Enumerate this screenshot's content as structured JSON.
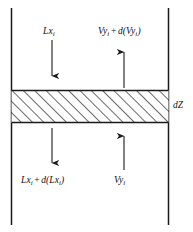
{
  "figure": {
    "canvas": {
      "width": 193,
      "height": 232
    },
    "colors": {
      "line": "#1a1a1a",
      "text": "#101010",
      "background": "#ffffff"
    }
  },
  "labels": {
    "liquid_in": {
      "base": "Lx",
      "sub": "i"
    },
    "vapor_out": {
      "base1": "Vy",
      "sub1": "i",
      "operator": "+",
      "base2": "d(Vy",
      "sub2": "i",
      "close": ")"
    },
    "liquid_out": {
      "base1": "Lx",
      "sub1": "i",
      "operator": "+",
      "base2": "d(Lx",
      "sub2": "i",
      "close": ")"
    },
    "vapor_in": {
      "base": "Vy",
      "sub": "i"
    },
    "height_element": "dZ"
  },
  "geometry": {
    "left_wall_x": 11,
    "right_wall_x": 168,
    "wall_top_y": 8,
    "wall_bottom_y": 225,
    "band_top_y": 90,
    "band_bottom_y": 123,
    "hatch_angle_deg": 45,
    "hatch_spacing_px": 8
  },
  "arrows": [
    {
      "name": "liquid-in-arrow",
      "direction": "down",
      "x": 52,
      "from_y": 40,
      "to_y": 83
    },
    {
      "name": "vapor-out-arrow",
      "direction": "up",
      "x": 124,
      "from_y": 88,
      "to_y": 44
    },
    {
      "name": "liquid-out-arrow",
      "direction": "down",
      "x": 52,
      "from_y": 128,
      "to_y": 170
    },
    {
      "name": "vapor-in-arrow",
      "direction": "up",
      "x": 124,
      "from_y": 170,
      "to_y": 129
    }
  ]
}
